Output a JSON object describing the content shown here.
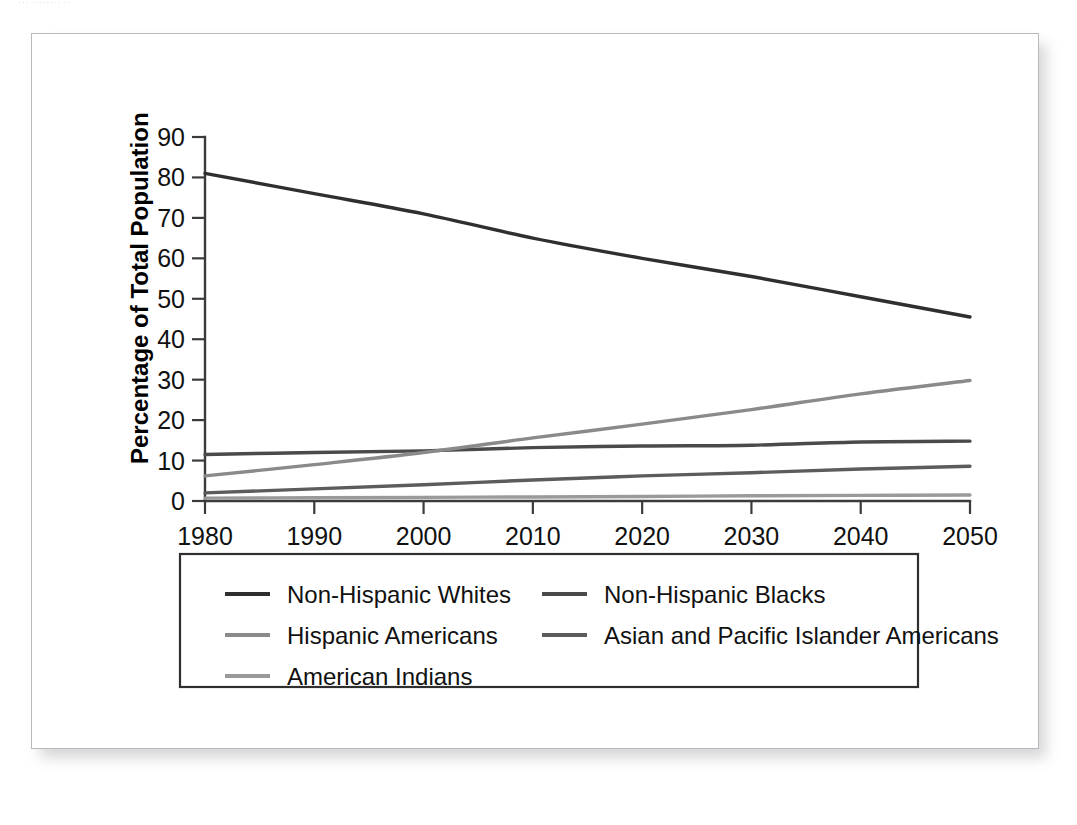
{
  "page": {
    "top_fragment_text": "··· ········ ··"
  },
  "chart_data": {
    "type": "line",
    "title": "",
    "xlabel": "",
    "ylabel": "Percentage of Total Population",
    "x": [
      1980,
      1990,
      2000,
      2010,
      2020,
      2030,
      2040,
      2050
    ],
    "xticks": [
      "1980",
      "1990",
      "2000",
      "2010",
      "2020",
      "2030",
      "2040",
      "2050"
    ],
    "yticks": [
      "0",
      "10",
      "20",
      "30",
      "40",
      "50",
      "60",
      "70",
      "80",
      "90"
    ],
    "xlim": [
      1980,
      2050
    ],
    "ylim": [
      0,
      90
    ],
    "grid": false,
    "legend_position": "below-plot",
    "series": [
      {
        "name": "Non-Hispanic Whites",
        "color": "#2f2f2f",
        "values": [
          81.0,
          76.0,
          71.0,
          65.0,
          60.0,
          55.5,
          50.5,
          45.5
        ]
      },
      {
        "name": "Non-Hispanic  Blacks",
        "color": "#4a4a4a",
        "values": [
          11.5,
          12.0,
          12.4,
          13.2,
          13.6,
          13.8,
          14.6,
          14.8
        ]
      },
      {
        "name": "Hispanic Americans",
        "color": "#8a8a8a",
        "values": [
          6.2,
          9.0,
          12.0,
          15.6,
          19.0,
          22.6,
          26.5,
          29.8
        ]
      },
      {
        "name": "Asian and Pacific Islander Americans",
        "color": "#5c5c5c",
        "values": [
          2.0,
          3.0,
          4.0,
          5.2,
          6.2,
          7.0,
          7.9,
          8.6
        ]
      },
      {
        "name": "American Indians",
        "color": "#9a9a9a",
        "values": [
          0.7,
          0.8,
          0.9,
          1.0,
          1.1,
          1.3,
          1.4,
          1.5
        ]
      }
    ]
  },
  "legend": {
    "entries": [
      {
        "label": "Non-Hispanic Whites",
        "color": "#2f2f2f"
      },
      {
        "label": "Non-Hispanic  Blacks",
        "color": "#4a4a4a"
      },
      {
        "label": "Hispanic Americans",
        "color": "#8a8a8a"
      },
      {
        "label": "Asian and Pacific Islander Americans",
        "color": "#5c5c5c"
      },
      {
        "label": "American Indians",
        "color": "#9a9a9a"
      }
    ]
  }
}
